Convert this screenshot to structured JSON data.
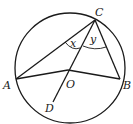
{
  "diagram": {
    "type": "circle-geometry",
    "stroke_color": "#1a1a1a",
    "background": "#ffffff",
    "circle": {
      "center": "O",
      "cx": 70,
      "cy": 68,
      "r": 55
    },
    "points": {
      "A": {
        "label": "A",
        "x": 16,
        "y": 79
      },
      "B": {
        "label": "B",
        "x": 120,
        "y": 79
      },
      "C": {
        "label": "C",
        "x": 95,
        "y": 20
      },
      "O": {
        "label": "O",
        "x": 68,
        "y": 70
      },
      "D": {
        "label": "D",
        "x": 53,
        "y": 102
      }
    },
    "segments": [
      "CA",
      "CB",
      "AO",
      "OB",
      "CD"
    ],
    "angles": {
      "x": {
        "label": "x",
        "between": "AC-CO"
      },
      "y": {
        "label": "y",
        "between": "OC-CB"
      }
    }
  }
}
